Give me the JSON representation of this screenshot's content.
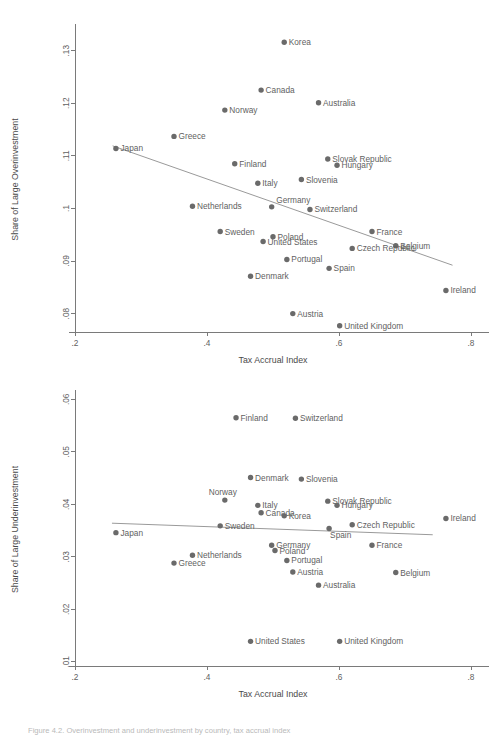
{
  "figure": {
    "caption": "Figure 4.2. Overinvestment and underinvestment by country, tax accrual index",
    "xlabel": "Tax Accrual Index"
  },
  "chart_data": [
    {
      "type": "scatter",
      "id": "overinvestment",
      "title": "",
      "xlabel": "Tax Accrual Index",
      "ylabel": "Share of Large Overinvestment",
      "xlim": [
        0.2,
        0.8
      ],
      "ylim": [
        0.0765,
        0.1345
      ],
      "xticks": [
        0.2,
        0.4,
        0.6,
        0.8
      ],
      "xticklabels": [
        ".2",
        ".4",
        ".6",
        ".8"
      ],
      "yticks": [
        0.08,
        0.09,
        0.1,
        0.11,
        0.12,
        0.13
      ],
      "yticklabels": [
        ".08",
        ".09",
        ".1",
        ".11",
        ".12",
        ".13"
      ],
      "grid": false,
      "legend": "none",
      "point_color": "#6a6a6a",
      "fit_line": {
        "x0": 0.257,
        "y0": 0.1119,
        "x1": 0.772,
        "y1": 0.0892,
        "color": "#9a9a9a"
      },
      "points": [
        {
          "label": "Korea",
          "x": 0.517,
          "y": 0.1316,
          "lab_side": "right"
        },
        {
          "label": "Canada",
          "x": 0.482,
          "y": 0.1225,
          "lab_side": "right"
        },
        {
          "label": "Australia",
          "x": 0.569,
          "y": 0.1201,
          "lab_side": "right"
        },
        {
          "label": "Norway",
          "x": 0.427,
          "y": 0.1187,
          "lab_side": "right"
        },
        {
          "label": "Greece",
          "x": 0.35,
          "y": 0.1137,
          "lab_side": "right"
        },
        {
          "label": "Japan",
          "x": 0.262,
          "y": 0.1114,
          "lab_side": "right"
        },
        {
          "label": "Slovak Republic",
          "x": 0.583,
          "y": 0.1094,
          "lab_side": "right"
        },
        {
          "label": "Hungary",
          "x": 0.597,
          "y": 0.1082,
          "lab_side": "right"
        },
        {
          "label": "Finland",
          "x": 0.442,
          "y": 0.1085,
          "lab_side": "right"
        },
        {
          "label": "Slovenia",
          "x": 0.543,
          "y": 0.1055,
          "lab_side": "right"
        },
        {
          "label": "Italy",
          "x": 0.477,
          "y": 0.1048,
          "lab_side": "right"
        },
        {
          "label": "Germany",
          "x": 0.498,
          "y": 0.1003,
          "lab_side": "right-up"
        },
        {
          "label": "Netherlands",
          "x": 0.378,
          "y": 0.1004,
          "lab_side": "right"
        },
        {
          "label": "Switzerland",
          "x": 0.556,
          "y": 0.0998,
          "lab_side": "right"
        },
        {
          "label": "France",
          "x": 0.65,
          "y": 0.0956,
          "lab_side": "right"
        },
        {
          "label": "Sweden",
          "x": 0.42,
          "y": 0.0956,
          "lab_side": "right"
        },
        {
          "label": "Poland",
          "x": 0.5,
          "y": 0.0946,
          "lab_side": "right"
        },
        {
          "label": "United States",
          "x": 0.485,
          "y": 0.0937,
          "lab_side": "right"
        },
        {
          "label": "Belgium",
          "x": 0.686,
          "y": 0.0929,
          "lab_side": "right"
        },
        {
          "label": "Czech Republic",
          "x": 0.62,
          "y": 0.0924,
          "lab_side": "right"
        },
        {
          "label": "Portugal",
          "x": 0.521,
          "y": 0.0903,
          "lab_side": "right"
        },
        {
          "label": "Spain",
          "x": 0.585,
          "y": 0.0886,
          "lab_side": "right"
        },
        {
          "label": "Denmark",
          "x": 0.466,
          "y": 0.0871,
          "lab_side": "right"
        },
        {
          "label": "Ireland",
          "x": 0.762,
          "y": 0.0844,
          "lab_side": "right"
        },
        {
          "label": "Austria",
          "x": 0.53,
          "y": 0.08,
          "lab_side": "right"
        },
        {
          "label": "United Kingdom",
          "x": 0.601,
          "y": 0.0777,
          "lab_side": "right"
        }
      ]
    },
    {
      "type": "scatter",
      "id": "underinvestment",
      "title": "",
      "xlabel": "Tax Accrual Index",
      "ylabel": "Share of Large Underinvestment",
      "xlim": [
        0.2,
        0.8
      ],
      "ylim": [
        0.0092,
        0.0612
      ],
      "xticks": [
        0.2,
        0.4,
        0.6,
        0.8
      ],
      "xticklabels": [
        ".2",
        ".4",
        ".6",
        ".8"
      ],
      "yticks": [
        0.01,
        0.02,
        0.03,
        0.04,
        0.05,
        0.06
      ],
      "yticklabels": [
        ".01",
        ".02",
        ".03",
        ".04",
        ".05",
        ".06"
      ],
      "grid": false,
      "legend": "none",
      "point_color": "#6a6a6a",
      "fit_line": {
        "x0": 0.256,
        "y0": 0.0364,
        "x1": 0.742,
        "y1": 0.0342,
        "color": "#9a9a9a"
      },
      "points": [
        {
          "label": "Finland",
          "x": 0.444,
          "y": 0.0565,
          "lab_side": "right"
        },
        {
          "label": "Switzerland",
          "x": 0.534,
          "y": 0.0564,
          "lab_side": "right"
        },
        {
          "label": "Denmark",
          "x": 0.466,
          "y": 0.0451,
          "lab_side": "right"
        },
        {
          "label": "Slovenia",
          "x": 0.543,
          "y": 0.0448,
          "lab_side": "right"
        },
        {
          "label": "Slovak Republic",
          "x": 0.583,
          "y": 0.0406,
          "lab_side": "right"
        },
        {
          "label": "Norway",
          "x": 0.427,
          "y": 0.0408,
          "lab_side": "above"
        },
        {
          "label": "Hungary",
          "x": 0.597,
          "y": 0.0398,
          "lab_side": "right"
        },
        {
          "label": "Italy",
          "x": 0.477,
          "y": 0.0398,
          "lab_side": "right"
        },
        {
          "label": "Canada",
          "x": 0.482,
          "y": 0.0384,
          "lab_side": "right"
        },
        {
          "label": "Korea",
          "x": 0.517,
          "y": 0.0378,
          "lab_side": "right"
        },
        {
          "label": "Ireland",
          "x": 0.762,
          "y": 0.0373,
          "lab_side": "right"
        },
        {
          "label": "Czech Republic",
          "x": 0.62,
          "y": 0.0361,
          "lab_side": "right"
        },
        {
          "label": "Sweden",
          "x": 0.42,
          "y": 0.0359,
          "lab_side": "right"
        },
        {
          "label": "Spain",
          "x": 0.585,
          "y": 0.0354,
          "lab_side": "right-down"
        },
        {
          "label": "Japan",
          "x": 0.262,
          "y": 0.0346,
          "lab_side": "right"
        },
        {
          "label": "France",
          "x": 0.65,
          "y": 0.0322,
          "lab_side": "right"
        },
        {
          "label": "Germany",
          "x": 0.498,
          "y": 0.0322,
          "lab_side": "right"
        },
        {
          "label": "Poland",
          "x": 0.503,
          "y": 0.0312,
          "lab_side": "right"
        },
        {
          "label": "Netherlands",
          "x": 0.378,
          "y": 0.0303,
          "lab_side": "right"
        },
        {
          "label": "Portugal",
          "x": 0.521,
          "y": 0.0293,
          "lab_side": "right"
        },
        {
          "label": "Greece",
          "x": 0.35,
          "y": 0.0288,
          "lab_side": "right"
        },
        {
          "label": "Austria",
          "x": 0.53,
          "y": 0.0271,
          "lab_side": "right"
        },
        {
          "label": "Belgium",
          "x": 0.686,
          "y": 0.027,
          "lab_side": "right"
        },
        {
          "label": "Australia",
          "x": 0.569,
          "y": 0.0246,
          "lab_side": "right"
        },
        {
          "label": "United States",
          "x": 0.466,
          "y": 0.0139,
          "lab_side": "right"
        },
        {
          "label": "United Kingdom",
          "x": 0.601,
          "y": 0.0139,
          "lab_side": "right"
        }
      ]
    }
  ]
}
